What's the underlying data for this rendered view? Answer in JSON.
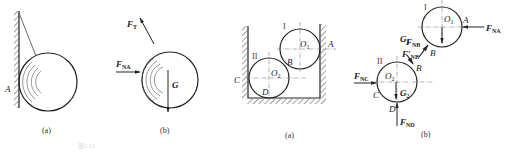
{
  "figure": {
    "panels": [
      {
        "id": "left-a",
        "caption": "(a)",
        "description": "Ball hanging against wall by rope",
        "labels": {
          "contact": "A"
        }
      },
      {
        "id": "left-b",
        "caption": "(b)",
        "description": "Free body diagram of ball",
        "labels": {
          "tension": "F",
          "tension_sub": "T",
          "normal": "F",
          "normal_sub": "NA",
          "weight": "G"
        }
      },
      {
        "id": "right-a",
        "caption": "(a)",
        "description": "Two cylinders in a box",
        "labels": {
          "cyl1": "I",
          "cyl2": "II",
          "o1": "O",
          "o1_sub": "1",
          "o2": "O",
          "o2_sub": "2",
          "A": "A",
          "B": "B",
          "C": "C",
          "D": "D"
        }
      },
      {
        "id": "right-b",
        "caption": "(b)",
        "description": "Free body diagrams of two cylinders",
        "labels": {
          "cyl1": "I",
          "cyl2": "II",
          "o1": "O",
          "o1_sub": "1",
          "o2": "O",
          "o2_sub": "2",
          "A": "A",
          "B1": "B",
          "B2": "B",
          "C": "C",
          "D": "D",
          "fna": "F",
          "fna_sub": "NA",
          "fnb": "F",
          "fnb_sub": "NB",
          "fnbp": "F′",
          "fnbp_sub": "NB",
          "fnc": "F",
          "fnc_sub": "NC",
          "fnd": "F",
          "fnd_sub": "ND",
          "g1": "G",
          "g1_sub": "1",
          "g2": "G",
          "g2_sub": "2"
        }
      }
    ],
    "footer_faint": "图1-11"
  }
}
